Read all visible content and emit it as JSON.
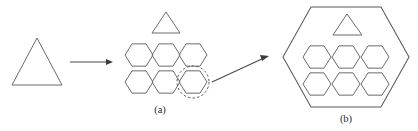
{
  "figure": {
    "width": 418,
    "height": 131,
    "background_color": "#ffffff",
    "stroke_color": "#6b6b6b",
    "arrow_color": "#4a4a4a",
    "dashed_color": "#555555",
    "caption_color": "#2b2b2b",
    "panels": [
      {
        "id": "a",
        "caption": "(a)",
        "caption_x": 160,
        "caption_y": 113,
        "description": "Triangle transformed by arrow into a cluster of six hexagons with a triangle above and one hexagon highlighted by a dashed circle"
      },
      {
        "id": "b",
        "caption": "(b)",
        "caption_x": 346,
        "caption_y": 122,
        "description": "Large hexagon containing one triangle and six smaller hexagons"
      }
    ],
    "shapes": {
      "source_triangle": {
        "name": "triangle",
        "points": "37,38 62,85 12,85",
        "panel": "a"
      },
      "horizontal_arrow": {
        "name": "transform-arrow",
        "x1": 70,
        "y1": 62,
        "x2": 110,
        "y2": 62,
        "head_points": "113,62 106,59 106,65"
      },
      "cluster_triangle": {
        "name": "triangle",
        "points": "166,12 180,33 152,33",
        "panel": "a"
      },
      "cluster_hexagons": {
        "name": "hexagon-cluster",
        "count": 6,
        "radius": 14,
        "centers": [
          {
            "cx": 139,
            "cy": 55
          },
          {
            "cx": 166,
            "cy": 55
          },
          {
            "cx": 193,
            "cy": 55
          },
          {
            "cx": 139,
            "cy": 82
          },
          {
            "cx": 166,
            "cy": 82
          },
          {
            "cx": 193,
            "cy": 82
          }
        ],
        "highlighted_index": 5
      },
      "highlight_circle": {
        "name": "dashed-highlight-circle",
        "cx": 193,
        "cy": 82,
        "r": 16
      },
      "diagonal_arrow": {
        "name": "zoom-arrow",
        "x1": 212,
        "y1": 82,
        "x2": 264,
        "y2": 58,
        "head_points": "269,56 260,55 262,61"
      },
      "big_hexagon": {
        "name": "large-hexagon",
        "points": "311,7 381,7 409,57 381,107 311,107 283,57",
        "panel": "b"
      },
      "big_hexagon_triangle": {
        "name": "triangle",
        "points": "347,14 362,35 333,35",
        "panel": "b"
      },
      "big_hexagon_inner_hexagons": {
        "name": "inner-hexagon-group",
        "count": 6,
        "radius": 14,
        "centers": [
          {
            "cx": 317,
            "cy": 57
          },
          {
            "cx": 346,
            "cy": 57
          },
          {
            "cx": 375,
            "cy": 57
          },
          {
            "cx": 317,
            "cy": 84
          },
          {
            "cx": 346,
            "cy": 84
          },
          {
            "cx": 375,
            "cy": 84
          }
        ],
        "panel": "b"
      }
    }
  }
}
